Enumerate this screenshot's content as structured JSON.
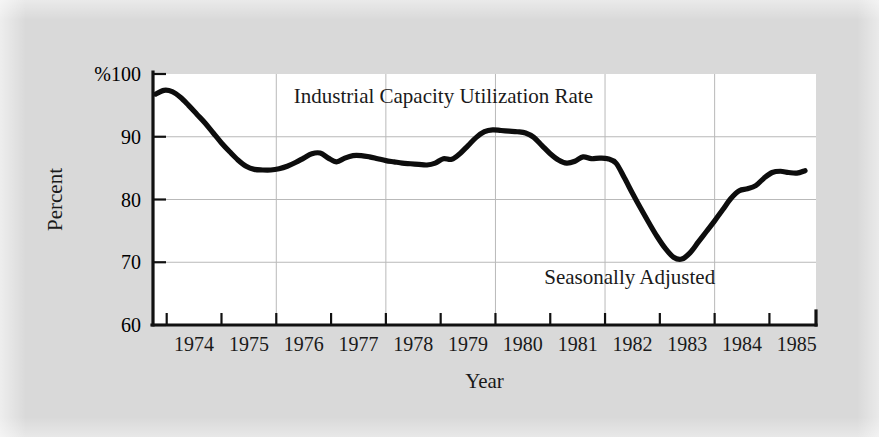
{
  "figure": {
    "background_color": "#d9d9d9",
    "plot_background_color": "#ffffff",
    "line_color": "#0d0d0d",
    "grid_color": "#b9b9b9"
  },
  "chart_data": {
    "type": "line",
    "title": "",
    "xlabel": "Year",
    "ylabel": "Percent",
    "y_unit_prefix": "%",
    "annotations": [
      {
        "name": "series-annotation",
        "text": "Industrial Capacity Utilization Rate",
        "x": 1979.05,
        "y": 95.3
      },
      {
        "name": "adjustment-annotation",
        "text": "Seasonally Adjusted",
        "x": 1982.45,
        "y": 66.6
      }
    ],
    "xlim": [
      1973.75,
      1985.85
    ],
    "ylim": [
      60,
      100
    ],
    "xticks": [
      1974,
      1975,
      1976,
      1977,
      1978,
      1979,
      1980,
      1981,
      1982,
      1983,
      1984,
      1985,
      1986
    ],
    "xtick_labels": [
      "1974",
      "1975",
      "1976",
      "1977",
      "1978",
      "1979",
      "1980",
      "1981",
      "1982",
      "1983",
      "1984",
      "1985"
    ],
    "yticks": [
      60,
      70,
      80,
      90,
      100
    ],
    "ytick_labels": [
      "60",
      "70",
      "80",
      "90",
      "%100"
    ],
    "grid": {
      "horizontal": [
        70,
        80,
        90
      ],
      "vertical": [
        1976,
        1978,
        1980,
        1982,
        1984
      ],
      "enabled": true
    },
    "legend": {
      "position": "none",
      "entries": []
    },
    "series": [
      {
        "name": "Industrial Capacity Utilization Rate",
        "color": "#0d0d0d",
        "x": [
          1973.8,
          1973.95,
          1974.1,
          1974.25,
          1974.4,
          1974.55,
          1974.7,
          1974.85,
          1975.0,
          1975.15,
          1975.3,
          1975.45,
          1975.6,
          1975.75,
          1975.9,
          1976.05,
          1976.2,
          1976.35,
          1976.5,
          1976.65,
          1976.8,
          1976.95,
          1977.1,
          1977.25,
          1977.4,
          1977.55,
          1977.7,
          1977.85,
          1978.0,
          1978.15,
          1978.3,
          1978.45,
          1978.6,
          1978.75,
          1978.9,
          1979.05,
          1979.2,
          1979.35,
          1979.5,
          1979.65,
          1979.8,
          1979.95,
          1980.1,
          1980.25,
          1980.4,
          1980.55,
          1980.7,
          1980.85,
          1981.0,
          1981.15,
          1981.3,
          1981.45,
          1981.6,
          1981.75,
          1981.9,
          1982.05,
          1982.2,
          1982.35,
          1982.5,
          1982.65,
          1982.8,
          1982.95,
          1983.1,
          1983.25,
          1983.4,
          1983.55,
          1983.7,
          1983.85,
          1984.0,
          1984.15,
          1984.3,
          1984.45,
          1984.6,
          1984.75,
          1984.9,
          1985.05,
          1985.2,
          1985.35,
          1985.5,
          1985.65
        ],
        "y": [
          96.8,
          97.4,
          97.2,
          96.3,
          95.0,
          93.6,
          92.2,
          90.6,
          89.0,
          87.6,
          86.3,
          85.3,
          84.8,
          84.7,
          84.7,
          84.9,
          85.3,
          85.9,
          86.6,
          87.3,
          87.4,
          86.6,
          86.0,
          86.6,
          87.0,
          87.0,
          86.8,
          86.5,
          86.2,
          86.0,
          85.8,
          85.7,
          85.6,
          85.5,
          85.8,
          86.5,
          86.4,
          87.3,
          88.6,
          89.9,
          90.8,
          91.1,
          91.0,
          90.9,
          90.8,
          90.6,
          89.9,
          88.6,
          87.3,
          86.3,
          85.8,
          86.1,
          86.8,
          86.5,
          86.6,
          86.5,
          85.8,
          83.5,
          81.0,
          78.6,
          76.3,
          74.1,
          72.2,
          70.8,
          70.5,
          71.5,
          73.2,
          74.9,
          76.6,
          78.4,
          80.2,
          81.4,
          81.7,
          82.2,
          83.4,
          84.3,
          84.5,
          84.3,
          84.2,
          84.6
        ]
      }
    ]
  }
}
